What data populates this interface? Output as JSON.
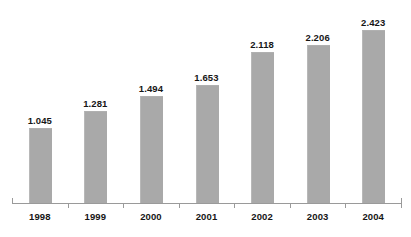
{
  "chart_data": {
    "type": "bar",
    "title": "",
    "subtitle": "",
    "xlabel": "",
    "ylabel": "",
    "categories": [
      "1998",
      "1999",
      "2000",
      "2001",
      "2002",
      "2003",
      "2004"
    ],
    "values": [
      1.045,
      1.281,
      1.494,
      1.653,
      2.118,
      2.206,
      2.423
    ],
    "value_labels": [
      "1.045",
      "1.281",
      "1.494",
      "1.653",
      "2.118",
      "2.206",
      "2.423"
    ],
    "series": [
      {
        "name": "",
        "values": [
          1.045,
          1.281,
          1.494,
          1.653,
          2.118,
          2.206,
          2.423
        ]
      }
    ],
    "ylim": [
      0,
      2.6
    ],
    "grid": false,
    "legend": false,
    "legend_position": "none",
    "bar_color": "#a9a9a9",
    "axis_color": "#9a9a9a",
    "label_color": "#161616",
    "background_color": "#ffffff"
  }
}
